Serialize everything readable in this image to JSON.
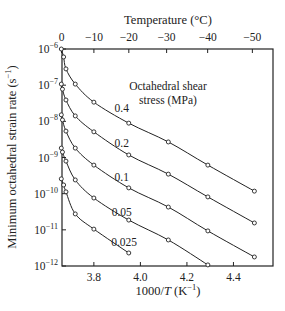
{
  "chart_data": {
    "type": "line",
    "title": "",
    "xlabel": "1000/T (K⁻¹)",
    "xlabel_parts": {
      "pre": "1000/",
      "italic": "T",
      "post": " (K",
      "sup": "−1",
      "close": ")"
    },
    "ylabel": "Minimum octahedral strain rate (s⁻¹)",
    "ylabel_parts": {
      "pre": "Minimum octahedral strain rate  (s",
      "sup": "−1",
      "close": ")"
    },
    "top_axis_label": "Temperature (°C)",
    "y_scale": "log",
    "xlim": [
      3.663,
      4.57
    ],
    "ylim": [
      1e-12,
      1e-06
    ],
    "x_ticks": [
      3.8,
      4.0,
      4.2,
      4.4
    ],
    "x_tick_labels": [
      "3.8",
      "4.0",
      "4.2",
      "4.4"
    ],
    "y_ticks_exp": [
      -6,
      -7,
      -8,
      -9,
      -10,
      -11,
      -12
    ],
    "y_tick_labels": [
      "10",
      "10",
      "10",
      "10",
      "10",
      "10",
      "10"
    ],
    "top_ticks_celsius": [
      0,
      -10,
      -20,
      -30,
      -40,
      -50
    ],
    "top_tick_labels": [
      "0",
      "−10",
      "−20",
      "−30",
      "−40",
      "−50"
    ],
    "legend_title": [
      "Octahedral shear",
      "stress (MPa)"
    ],
    "grid": false,
    "series": [
      {
        "name": "0.4",
        "label_pos": [
          3.92,
          -7.75
        ],
        "x": [
          3.66,
          3.67,
          3.68,
          3.72,
          3.8,
          3.95,
          4.12,
          4.29,
          4.49
        ],
        "log_y": [
          -6.0,
          -6.22,
          -6.55,
          -6.97,
          -7.47,
          -8.05,
          -8.57,
          -9.21,
          -9.93
        ]
      },
      {
        "name": "0.2",
        "label_pos": [
          3.92,
          -8.72
        ],
        "x": [
          3.66,
          3.665,
          3.68,
          3.72,
          3.8,
          3.95,
          4.12,
          4.29,
          4.49
        ],
        "log_y": [
          -6.97,
          -7.11,
          -7.41,
          -7.85,
          -8.29,
          -8.93,
          -9.46,
          -10.09,
          -10.81
        ]
      },
      {
        "name": "0.1",
        "label_pos": [
          3.92,
          -9.66
        ],
        "x": [
          3.66,
          3.665,
          3.68,
          3.72,
          3.8,
          3.95,
          4.12,
          4.29,
          4.49
        ],
        "log_y": [
          -7.82,
          -7.96,
          -8.27,
          -8.74,
          -9.21,
          -9.84,
          -10.37,
          -11.03,
          -11.75
        ]
      },
      {
        "name": "0.05",
        "label_pos": [
          3.92,
          -10.62
        ],
        "x": [
          3.66,
          3.665,
          3.68,
          3.72,
          3.8,
          3.95,
          4.12,
          4.29
        ],
        "log_y": [
          -8.74,
          -8.85,
          -9.1,
          -9.62,
          -10.12,
          -10.73,
          -11.28,
          -11.97
        ]
      },
      {
        "name": "0.025",
        "label_pos": [
          3.93,
          -11.45
        ],
        "x": [
          3.66,
          3.67,
          3.68,
          3.72,
          3.8,
          3.95
        ],
        "log_y": [
          -9.59,
          -9.76,
          -9.95,
          -10.56,
          -10.98,
          -11.64
        ]
      }
    ]
  }
}
